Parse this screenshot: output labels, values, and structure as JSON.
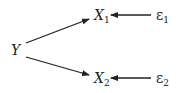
{
  "diagram": {
    "nodes": [
      {
        "id": "Y",
        "label": "Y",
        "sub": ""
      },
      {
        "id": "X1",
        "label": "X",
        "sub": "1"
      },
      {
        "id": "X2",
        "label": "X",
        "sub": "2"
      },
      {
        "id": "e1",
        "label": "ε",
        "sub": "1"
      },
      {
        "id": "e2",
        "label": "ε",
        "sub": "2"
      }
    ],
    "edges": [
      {
        "from": "Y",
        "to": "X1"
      },
      {
        "from": "Y",
        "to": "X2"
      },
      {
        "from": "e1",
        "to": "X1"
      },
      {
        "from": "e2",
        "to": "X2"
      }
    ],
    "colors": {
      "stroke": "#222222",
      "background": "#ffffff"
    }
  }
}
